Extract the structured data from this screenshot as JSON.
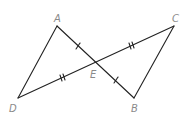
{
  "diagram": {
    "stroke_color": "#222222",
    "label_color": "#8a8a8a",
    "points": {
      "A": {
        "label": "A",
        "x": 57,
        "y": 26
      },
      "B": {
        "label": "B",
        "x": 134,
        "y": 98
      },
      "C": {
        "label": "C",
        "x": 174,
        "y": 26
      },
      "D": {
        "label": "D",
        "x": 18,
        "y": 98
      },
      "E": {
        "label": "E",
        "x": 96,
        "y": 62
      }
    },
    "segments": [
      "AD",
      "AB",
      "DC",
      "CB"
    ],
    "tick_marks": [
      {
        "segment": "AE",
        "ticks": 1
      },
      {
        "segment": "EB",
        "ticks": 1
      },
      {
        "segment": "DE",
        "ticks": 2
      },
      {
        "segment": "EC",
        "ticks": 2
      }
    ]
  }
}
